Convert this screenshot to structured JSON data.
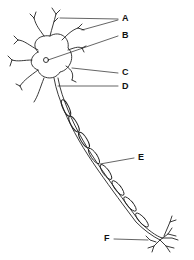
{
  "diagram": {
    "labels": [
      {
        "id": "A",
        "text": "A"
      },
      {
        "id": "B",
        "text": "B"
      },
      {
        "id": "C",
        "text": "C"
      },
      {
        "id": "D",
        "text": "D"
      },
      {
        "id": "E",
        "text": "E"
      },
      {
        "id": "F",
        "text": "F"
      }
    ]
  }
}
